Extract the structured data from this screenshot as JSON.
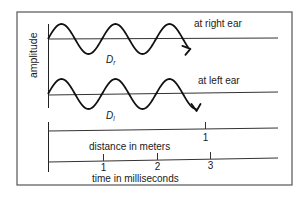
{
  "diagram": {
    "y_axis_label": "amplitude",
    "waves": [
      {
        "label": "at right ear",
        "marker_label": "D",
        "marker_subscript": "r",
        "cycles": 2.6,
        "arrow_direction": "up"
      },
      {
        "label": "at left ear",
        "marker_label": "D",
        "marker_subscript": "l",
        "cycles": 2.75,
        "arrow_direction": "down"
      }
    ],
    "distance_axis": {
      "label": "distance in meters",
      "ticks": [
        "1"
      ]
    },
    "time_axis": {
      "label": "time in milliseconds",
      "ticks": [
        "1",
        "2",
        "3"
      ]
    },
    "colors": {
      "line": "#1a1a1a",
      "frame": "#444444"
    }
  }
}
